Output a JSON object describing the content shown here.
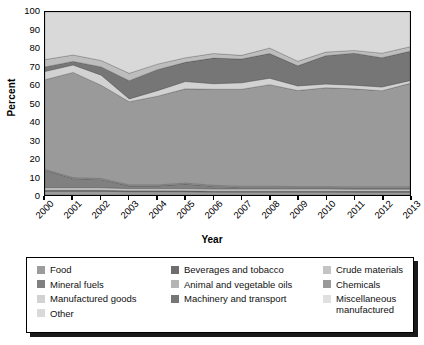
{
  "chart_data": {
    "type": "area",
    "stacked": true,
    "title": "",
    "xlabel": "Year",
    "ylabel": "Percent",
    "ylim": [
      0,
      100
    ],
    "yticks": [
      0,
      10,
      20,
      30,
      40,
      50,
      60,
      70,
      80,
      90,
      100
    ],
    "grid": false,
    "legend_position": "bottom",
    "categories": [
      "2000",
      "2001",
      "2002",
      "2003",
      "2004",
      "2005",
      "2006",
      "2007",
      "2008",
      "2009",
      "2010",
      "2011",
      "2012",
      "2013"
    ],
    "series": [
      {
        "name": "Food",
        "color": "#9c9c9c",
        "values": [
          2.0,
          2.0,
          2.0,
          1.8,
          1.8,
          1.8,
          1.6,
          1.6,
          1.6,
          1.6,
          1.6,
          1.5,
          1.5,
          1.5
        ]
      },
      {
        "name": "Beverages and tobacco",
        "color": "#6e6e6e",
        "values": [
          0.6,
          0.6,
          0.6,
          0.5,
          0.5,
          0.5,
          0.5,
          0.5,
          0.5,
          0.5,
          0.5,
          0.5,
          0.5,
          0.5
        ]
      },
      {
        "name": "Crude materials",
        "color": "#c4c4c4",
        "values": [
          1.4,
          1.4,
          1.4,
          1.2,
          1.2,
          1.2,
          1.2,
          1.2,
          1.2,
          1.2,
          1.2,
          1.2,
          1.2,
          1.2
        ]
      },
      {
        "name": "Mineral fuels",
        "color": "#808080",
        "values": [
          9.5,
          5.0,
          4.5,
          1.5,
          1.5,
          2.5,
          1.5,
          1.0,
          1.0,
          0.8,
          0.8,
          0.8,
          0.8,
          0.8
        ]
      },
      {
        "name": "Animal and vegetable oils",
        "color": "#b4b4b4",
        "values": [
          0.5,
          0.5,
          0.5,
          0.5,
          0.5,
          0.5,
          0.5,
          0.5,
          0.5,
          0.5,
          0.5,
          0.5,
          0.5,
          0.5
        ]
      },
      {
        "name": "Chemicals",
        "color": "#9a9a9a",
        "values": [
          49.0,
          57.5,
          51.0,
          45.5,
          48.5,
          51.5,
          52.5,
          53.0,
          55.5,
          52.5,
          54.0,
          53.5,
          52.5,
          56.5
        ]
      },
      {
        "name": "Manufactured goods",
        "color": "#d2d2d2",
        "values": [
          4.5,
          4.0,
          5.5,
          1.5,
          3.0,
          4.0,
          3.0,
          3.5,
          3.5,
          2.5,
          2.0,
          2.0,
          2.0,
          1.5
        ]
      },
      {
        "name": "Machinery and transport",
        "color": "#767676",
        "values": [
          2.5,
          2.0,
          4.5,
          10.0,
          11.5,
          10.5,
          14.0,
          13.0,
          13.5,
          11.0,
          15.5,
          17.5,
          16.0,
          16.0
        ]
      },
      {
        "name": "Miscellaneous manufactured",
        "color": "#bdbdbd",
        "values": [
          4.0,
          3.5,
          3.5,
          4.0,
          3.0,
          2.5,
          2.5,
          2.0,
          3.0,
          2.5,
          2.0,
          1.5,
          2.5,
          2.5
        ]
      },
      {
        "name": "Other",
        "color": "#d9d9d9",
        "values": [
          26.0,
          23.5,
          26.5,
          33.5,
          28.5,
          25.0,
          22.7,
          23.7,
          19.7,
          26.9,
          21.9,
          21.0,
          22.5,
          19.0
        ]
      }
    ]
  },
  "axes": {
    "ylabel": "Percent",
    "xlabel": "Year",
    "ytick_labels": [
      "100",
      "90",
      "80",
      "70",
      "60",
      "50",
      "40",
      "30",
      "20",
      "10",
      "0"
    ],
    "xtick_labels": [
      "2000",
      "2001",
      "2002",
      "2003",
      "2004",
      "2005",
      "2006",
      "2007",
      "2008",
      "2009",
      "2010",
      "2011",
      "2012",
      "2013"
    ]
  },
  "legend": {
    "columns": [
      [
        {
          "label": "Food",
          "color": "#9c9c9c"
        },
        {
          "label": "Mineral fuels",
          "color": "#808080"
        },
        {
          "label": "Manufactured goods",
          "color": "#d2d2d2"
        },
        {
          "label": "Other",
          "color": "#d9d9d9"
        }
      ],
      [
        {
          "label": "Beverages and tobacco",
          "color": "#6e6e6e"
        },
        {
          "label": "Animal and vegetable oils",
          "color": "#b4b4b4"
        },
        {
          "label": "Machinery and transport",
          "color": "#767676"
        }
      ],
      [
        {
          "label": "Crude materials",
          "color": "#c4c4c4"
        },
        {
          "label": "Chemicals",
          "color": "#9a9a9a"
        },
        {
          "label": "Miscellaneous\nmanufactured",
          "color": "#e0e0e0"
        }
      ]
    ]
  }
}
